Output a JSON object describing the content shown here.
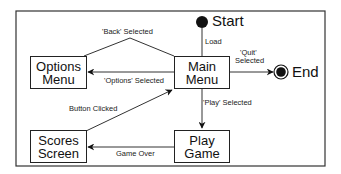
{
  "diagram": {
    "type": "state-machine",
    "states": {
      "start": {
        "label": "Start"
      },
      "end": {
        "label": "End"
      },
      "main_menu": {
        "line1": "Main",
        "line2": "Menu"
      },
      "options_menu": {
        "line1": "Options",
        "line2": "Menu"
      },
      "play_game": {
        "line1": "Play",
        "line2": "Game"
      },
      "scores_screen": {
        "line1": "Scores",
        "line2": "Screen"
      }
    },
    "transitions": {
      "load": {
        "from": "Start",
        "to": "Main Menu",
        "label": "Load"
      },
      "options": {
        "from": "Main Menu",
        "to": "Options Menu",
        "label": "'Options' Selected"
      },
      "back": {
        "from": "Options Menu",
        "to": "Main Menu",
        "label": "'Back' Selected"
      },
      "quit": {
        "from": "Main Menu",
        "to": "End",
        "label_line1": "'Quit'",
        "label_line2": "Selected"
      },
      "play": {
        "from": "Main Menu",
        "to": "Play Game",
        "label": "'Play' Selected"
      },
      "game_over": {
        "from": "Play Game",
        "to": "Scores Screen",
        "label": "Game Over"
      },
      "button_clicked": {
        "from": "Scores Screen",
        "to": "Main Menu",
        "label": "Button Clicked"
      }
    }
  }
}
